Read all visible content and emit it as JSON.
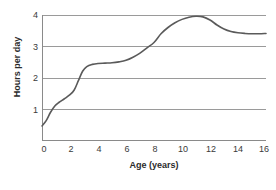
{
  "chart_data": {
    "type": "line",
    "title": "",
    "xlabel": "Age (years)",
    "ylabel": "Hours per day",
    "xlim": [
      0,
      16
    ],
    "ylim": [
      0,
      4
    ],
    "xticks": [
      "0",
      "2",
      "4",
      "6",
      "8",
      "10",
      "12",
      "14",
      "16"
    ],
    "xtick_values": [
      0,
      2,
      4,
      6,
      8,
      10,
      12,
      14,
      16
    ],
    "yticks": [
      "1",
      "2",
      "3",
      "4"
    ],
    "ytick_values": [
      1,
      2,
      3,
      4
    ],
    "grid": "horizontal",
    "legend": "none",
    "series": [
      {
        "name": "Hours per day",
        "color": "#5a5a5a",
        "x": [
          0,
          0.3,
          0.6,
          0.9,
          1.2,
          1.6,
          2.0,
          2.3,
          2.6,
          2.9,
          3.2,
          3.6,
          4.0,
          4.5,
          5.0,
          5.5,
          6.0,
          6.5,
          7.0,
          7.5,
          8.0,
          8.5,
          9.0,
          9.5,
          10.0,
          10.5,
          11.0,
          11.5,
          12.0,
          12.5,
          13.0,
          13.5,
          14.0,
          14.5,
          15.0,
          15.5,
          16.0
        ],
        "values": [
          0.45,
          0.62,
          0.88,
          1.08,
          1.2,
          1.32,
          1.45,
          1.6,
          1.9,
          2.2,
          2.35,
          2.42,
          2.45,
          2.46,
          2.47,
          2.5,
          2.55,
          2.65,
          2.78,
          2.95,
          3.12,
          3.4,
          3.6,
          3.75,
          3.86,
          3.93,
          3.96,
          3.94,
          3.84,
          3.68,
          3.55,
          3.47,
          3.43,
          3.41,
          3.4,
          3.4,
          3.41
        ]
      }
    ]
  },
  "axes": {
    "y_axis_label": "Hours per day",
    "x_axis_label": "Age (years)"
  },
  "colors": {
    "curve": "#5a5a5a",
    "gridline": "#9a9a9a",
    "axis": "#8a8a8a",
    "text": "#3a3a3a"
  }
}
